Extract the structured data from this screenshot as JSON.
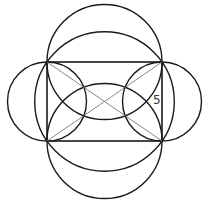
{
  "diagram": {
    "side_label": "5",
    "stroke_color": "#1a1a1a",
    "diagonal_color": "#777777",
    "rectangle": {
      "x": 47,
      "y": 62,
      "width": 115,
      "height": 79
    },
    "circles": [
      {
        "name": "left-side-circle",
        "cx": 47,
        "cy": 101.5,
        "r": 39.5
      },
      {
        "name": "right-side-circle",
        "cx": 162,
        "cy": 101.5,
        "r": 39.5
      },
      {
        "name": "top-side-circle",
        "cx": 104.5,
        "cy": 62,
        "r": 57.5
      },
      {
        "name": "bottom-side-circle",
        "cx": 104.5,
        "cy": 141,
        "r": 57.5
      },
      {
        "name": "circumcircle",
        "cx": 104.5,
        "cy": 101.5,
        "r": 69.8
      }
    ]
  }
}
